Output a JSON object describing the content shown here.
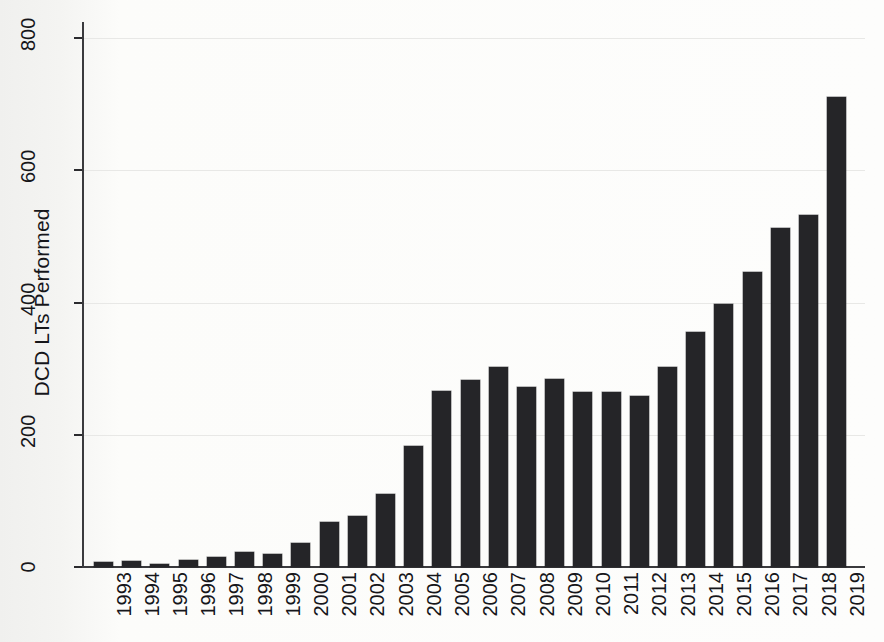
{
  "figure": {
    "background_color": "#fbfbf9",
    "bar_color": "#252528",
    "axis_color": "#3a3a3d",
    "gridline_color": "#e8e8e6"
  },
  "axes": {
    "y_title": "DCD LTs Performed",
    "y_ticks": [
      "0",
      "200",
      "400",
      "600",
      "800"
    ],
    "x_title": ""
  },
  "chart_data": {
    "type": "bar",
    "title": "",
    "xlabel": "",
    "ylabel": "DCD LTs Performed",
    "ylim": [
      0,
      850
    ],
    "yticks": [
      0,
      200,
      400,
      600,
      800
    ],
    "grid": true,
    "legend": "none",
    "categories": [
      "1993",
      "1994",
      "1995",
      "1996",
      "1997",
      "1998",
      "1999",
      "2000",
      "2001",
      "2002",
      "2003",
      "2004",
      "2005",
      "2006",
      "2007",
      "2008",
      "2009",
      "2010",
      "2011",
      "2012",
      "2013",
      "2014",
      "2015",
      "2016",
      "2017",
      "2018",
      "2019"
    ],
    "values": [
      8,
      9,
      5,
      10,
      15,
      22,
      20,
      37,
      68,
      77,
      110,
      183,
      266,
      283,
      303,
      272,
      284,
      264,
      264,
      259,
      303,
      355,
      398,
      446,
      512,
      533,
      711
    ]
  }
}
